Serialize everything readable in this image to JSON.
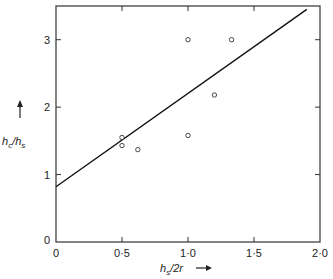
{
  "chart_data": {
    "type": "scatter",
    "title": "",
    "xlabel": "h_s/2r",
    "ylabel": "h_c/h_s",
    "xlim": [
      0,
      2.0
    ],
    "ylim": [
      0,
      3.5
    ],
    "x_ticks": [
      "0",
      "0·5",
      "1·0",
      "1·5",
      "2·0"
    ],
    "y_ticks": [
      "0",
      "1",
      "2",
      "3"
    ],
    "grid": false,
    "legend": null,
    "series": [
      {
        "name": "data",
        "marker": "open-circle",
        "points": [
          {
            "x": 0.5,
            "y": 1.55
          },
          {
            "x": 0.5,
            "y": 1.43
          },
          {
            "x": 0.62,
            "y": 1.37
          },
          {
            "x": 1.0,
            "y": 1.58
          },
          {
            "x": 1.0,
            "y": 3.0
          },
          {
            "x": 1.2,
            "y": 2.18
          },
          {
            "x": 1.33,
            "y": 3.0
          }
        ]
      },
      {
        "name": "fit",
        "type": "line",
        "points": [
          {
            "x": 0.0,
            "y": 0.82
          },
          {
            "x": 1.9,
            "y": 3.45
          }
        ]
      }
    ]
  }
}
